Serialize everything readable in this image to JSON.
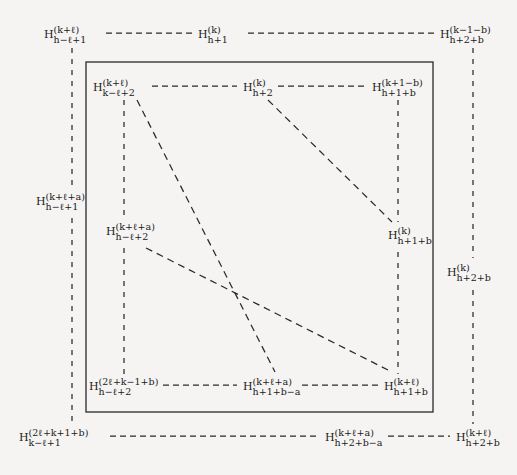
{
  "figure": {
    "type": "commutative-diagram",
    "background_color": "#f5f4f2",
    "line_color": "#2a2a2a",
    "text_color": "#1a1a1a"
  },
  "nodes": [
    {
      "id": "outer-top-left",
      "base": "H",
      "sup": "(k+ℓ)",
      "sub": "h−ℓ+1",
      "x": 44,
      "y": 25,
      "anchor": "left"
    },
    {
      "id": "outer-top-mid",
      "base": "H",
      "sup": "(k)",
      "sub": "h+1",
      "x": 198,
      "y": 25,
      "anchor": "left"
    },
    {
      "id": "outer-top-right",
      "base": "H",
      "sup": "(k−1−b)",
      "sub": "h+2+b",
      "x": 440,
      "y": 25,
      "anchor": "left"
    },
    {
      "id": "inner-top-left",
      "base": "H",
      "sup": "(k+ℓ)",
      "sub": "k−ℓ+2",
      "x": 93,
      "y": 78,
      "anchor": "left"
    },
    {
      "id": "inner-top-mid",
      "base": "H",
      "sup": "(k)",
      "sub": "h+2",
      "x": 243,
      "y": 78,
      "anchor": "left"
    },
    {
      "id": "inner-top-right",
      "base": "H",
      "sup": "(k+1−b)",
      "sub": "h+1+b",
      "x": 372,
      "y": 78,
      "anchor": "left"
    },
    {
      "id": "outer-mid-left",
      "base": "H",
      "sup": "(k+ℓ+a)",
      "sub": "h−ℓ+1",
      "x": 36,
      "y": 192,
      "anchor": "left"
    },
    {
      "id": "inner-mid-left",
      "base": "H",
      "sup": "(k+ℓ+a)",
      "sub": "h−ℓ+2",
      "x": 106,
      "y": 222,
      "anchor": "left"
    },
    {
      "id": "inner-mid-right",
      "base": "H",
      "sup": "(k)",
      "sub": "h+1+b",
      "x": 388,
      "y": 226,
      "anchor": "left"
    },
    {
      "id": "outer-mid-right",
      "base": "H",
      "sup": "(k)",
      "sub": "h+2+b",
      "x": 447,
      "y": 263,
      "anchor": "left"
    },
    {
      "id": "inner-bottom-left",
      "base": "H",
      "sup": "(2ℓ+k−1+b)",
      "sub": "h−ℓ+2",
      "x": 89,
      "y": 377,
      "anchor": "left"
    },
    {
      "id": "inner-bottom-mid",
      "base": "H",
      "sup": "(k+ℓ+a)",
      "sub": "h+1+b−a",
      "x": 243,
      "y": 377,
      "anchor": "left"
    },
    {
      "id": "inner-bottom-right",
      "base": "H",
      "sup": "(k+ℓ)",
      "sub": "h+1+b",
      "x": 384,
      "y": 377,
      "anchor": "left"
    },
    {
      "id": "outer-bottom-left",
      "base": "H",
      "sup": "(2ℓ+k+1+b)",
      "sub": "k−ℓ+1",
      "x": 19,
      "y": 428,
      "anchor": "left"
    },
    {
      "id": "outer-bottom-mid",
      "base": "H",
      "sup": "(k+ℓ+a)",
      "sub": "h+2+b−a",
      "x": 325,
      "y": 428,
      "anchor": "left"
    },
    {
      "id": "outer-bottom-right",
      "base": "H",
      "sup": "(k+ℓ)",
      "sub": "h+2+b",
      "x": 456,
      "y": 428,
      "anchor": "left"
    }
  ],
  "edges": {
    "solid_rectangle": {
      "x": 86,
      "y": 62,
      "width": 347,
      "height": 350,
      "stroke": "#2a2a2a",
      "stroke_width": 1.3
    },
    "dashed_horizontal": [
      {
        "id": "outer-top-left-to-mid",
        "x1": 106,
        "y1": 33,
        "x2": 192,
        "y2": 33
      },
      {
        "id": "outer-top-mid-to-right",
        "x1": 248,
        "y1": 33,
        "x2": 434,
        "y2": 33
      },
      {
        "id": "inner-top-left-to-mid",
        "x1": 152,
        "y1": 86,
        "x2": 237,
        "y2": 86
      },
      {
        "id": "inner-top-mid-to-right",
        "x1": 278,
        "y1": 86,
        "x2": 366,
        "y2": 86
      },
      {
        "id": "inner-bottom-left-to-mid",
        "x1": 163,
        "y1": 385,
        "x2": 237,
        "y2": 385
      },
      {
        "id": "inner-bottom-mid-to-right",
        "x1": 302,
        "y1": 385,
        "x2": 378,
        "y2": 385
      },
      {
        "id": "outer-bottom-left-to-mid",
        "x1": 110,
        "y1": 436,
        "x2": 318,
        "y2": 436
      },
      {
        "id": "outer-bottom-mid-to-right",
        "x1": 388,
        "y1": 436,
        "x2": 450,
        "y2": 436
      }
    ],
    "dashed_vertical": [
      {
        "id": "outer-left-vertical",
        "x1": 72,
        "y1": 48,
        "x2": 72,
        "y2": 188
      },
      {
        "id": "outer-left-vertical2",
        "x1": 72,
        "y1": 218,
        "x2": 72,
        "y2": 424
      },
      {
        "id": "inner-left-vertical",
        "x1": 124,
        "y1": 100,
        "x2": 124,
        "y2": 218
      },
      {
        "id": "inner-left-vertical2",
        "x1": 124,
        "y1": 248,
        "x2": 124,
        "y2": 374
      },
      {
        "id": "inner-right-vertical",
        "x1": 398,
        "y1": 100,
        "x2": 398,
        "y2": 222
      },
      {
        "id": "inner-right-vertical2",
        "x1": 398,
        "y1": 252,
        "x2": 398,
        "y2": 374
      },
      {
        "id": "outer-right-vertical",
        "x1": 473,
        "y1": 48,
        "x2": 473,
        "y2": 258
      },
      {
        "id": "outer-right-vertical2",
        "x1": 473,
        "y1": 290,
        "x2": 473,
        "y2": 424
      }
    ],
    "dashed_diagonal": [
      {
        "id": "diag-topleft-to-bottommid",
        "x1": 137,
        "y1": 100,
        "x2": 275,
        "y2": 372
      },
      {
        "id": "diag-topmid-to-midright",
        "x1": 268,
        "y1": 100,
        "x2": 392,
        "y2": 222
      },
      {
        "id": "diag-midleft-to-bottomright",
        "x1": 146,
        "y1": 248,
        "x2": 392,
        "y2": 372
      }
    ]
  }
}
